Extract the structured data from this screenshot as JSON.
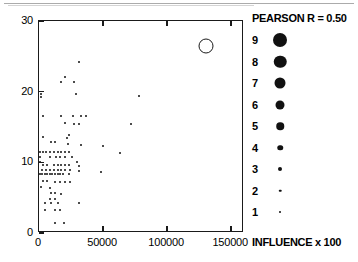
{
  "chart_data": {
    "type": "scatter",
    "title": "",
    "xlabel": "",
    "ylabel": "",
    "xlim": [
      0,
      160000
    ],
    "ylim": [
      0,
      30
    ],
    "grid": false,
    "xticks": [
      0,
      50000,
      100000,
      150000
    ],
    "xtick_labels": [
      "0",
      "50000",
      "100000",
      "150000"
    ],
    "yticks": [
      0,
      10,
      20,
      30
    ],
    "ytick_labels": [
      "0",
      "10",
      "20",
      "30"
    ],
    "legend_position": "right",
    "annotations": [
      "PEARSON R = 0.50",
      "INFLUENCE x 100"
    ],
    "size_legend": {
      "title": "PEARSON R = 0.50",
      "footer": "INFLUENCE x 100",
      "entries": [
        {
          "label": "9",
          "marker_px": 14
        },
        {
          "label": "8",
          "marker_px": 12.5
        },
        {
          "label": "7",
          "marker_px": 11
        },
        {
          "label": "6",
          "marker_px": 9
        },
        {
          "label": "5",
          "marker_px": 7.5
        },
        {
          "label": "4",
          "marker_px": 5.5
        },
        {
          "label": "3",
          "marker_px": 4
        },
        {
          "label": "2",
          "marker_px": 2.5
        },
        {
          "label": "1",
          "marker_px": 2
        }
      ]
    },
    "series": [
      {
        "name": "observations",
        "marker": "filled-circle",
        "color": "#111111",
        "points": [
          [
            1500,
            19.6,
            2
          ],
          [
            1200,
            19.3,
            2
          ],
          [
            20500,
            22.1,
            2
          ],
          [
            17500,
            21.3,
            2
          ],
          [
            27500,
            21.3,
            2
          ],
          [
            31000,
            24.2,
            2
          ],
          [
            28500,
            19.6,
            2
          ],
          [
            78000,
            19.4,
            2
          ],
          [
            3500,
            16.6,
            2
          ],
          [
            17500,
            16.6,
            2
          ],
          [
            26500,
            16.6,
            2
          ],
          [
            32500,
            16.6,
            2
          ],
          [
            36500,
            16.6,
            2
          ],
          [
            20500,
            15.5,
            2
          ],
          [
            27500,
            15.4,
            2
          ],
          [
            31000,
            15.4,
            2
          ],
          [
            71500,
            15.4,
            2
          ],
          [
            23500,
            13.9,
            2
          ],
          [
            3200,
            13.6,
            2
          ],
          [
            21500,
            13.5,
            2
          ],
          [
            9500,
            12.9,
            2
          ],
          [
            12500,
            12.9,
            2
          ],
          [
            23000,
            12.6,
            2
          ],
          [
            32500,
            12.4,
            2
          ],
          [
            50000,
            12.3,
            2
          ],
          [
            900,
            11.5,
            2
          ],
          [
            3000,
            11.5,
            2
          ],
          [
            5500,
            11.5,
            2
          ],
          [
            8500,
            11.5,
            2
          ],
          [
            11500,
            11.5,
            2
          ],
          [
            14500,
            11.5,
            2
          ],
          [
            17500,
            11.5,
            2
          ],
          [
            20500,
            11.5,
            2
          ],
          [
            23500,
            11.5,
            2
          ],
          [
            63000,
            11.3,
            2
          ],
          [
            600,
            10.8,
            2
          ],
          [
            8500,
            10.8,
            2
          ],
          [
            13500,
            10.8,
            2
          ],
          [
            16500,
            10.8,
            2
          ],
          [
            20500,
            10.8,
            2
          ],
          [
            25500,
            10.8,
            2
          ],
          [
            600,
            10.1,
            2
          ],
          [
            29500,
            10.0,
            2
          ],
          [
            3500,
            9.6,
            2
          ],
          [
            6500,
            9.6,
            2
          ],
          [
            11500,
            9.6,
            2
          ],
          [
            14500,
            9.6,
            2
          ],
          [
            17500,
            9.6,
            2
          ],
          [
            20500,
            9.6,
            2
          ],
          [
            23500,
            9.6,
            2
          ],
          [
            31000,
            9.5,
            2
          ],
          [
            2500,
            8.9,
            2
          ],
          [
            5500,
            8.9,
            2
          ],
          [
            8500,
            8.9,
            2
          ],
          [
            11500,
            8.9,
            2
          ],
          [
            14500,
            8.9,
            2
          ],
          [
            17500,
            8.9,
            2
          ],
          [
            20500,
            8.9,
            2
          ],
          [
            24500,
            8.9,
            2
          ],
          [
            31000,
            8.8,
            2
          ],
          [
            48500,
            8.7,
            2
          ],
          [
            600,
            8.3,
            2
          ],
          [
            2500,
            8.3,
            2
          ],
          [
            4500,
            8.3,
            2
          ],
          [
            6500,
            8.3,
            2
          ],
          [
            8500,
            8.3,
            2
          ],
          [
            10500,
            8.3,
            2
          ],
          [
            12500,
            8.3,
            2
          ],
          [
            14500,
            8.3,
            2
          ],
          [
            16500,
            8.3,
            2
          ],
          [
            18500,
            8.3,
            2
          ],
          [
            23500,
            8.3,
            2
          ],
          [
            3500,
            7.3,
            2
          ],
          [
            6000,
            7.3,
            2
          ],
          [
            12500,
            7.2,
            2
          ],
          [
            16500,
            7.2,
            2
          ],
          [
            20500,
            7.2,
            2
          ],
          [
            24500,
            7.2,
            2
          ],
          [
            1200,
            6.5,
            2
          ],
          [
            8500,
            6.4,
            2
          ],
          [
            9500,
            5.6,
            2
          ],
          [
            12500,
            5.6,
            2
          ],
          [
            17500,
            5.5,
            2
          ],
          [
            8500,
            4.8,
            2
          ],
          [
            12500,
            4.8,
            2
          ],
          [
            4500,
            4.3,
            2
          ],
          [
            9500,
            4.2,
            2
          ],
          [
            14500,
            4.2,
            2
          ],
          [
            31000,
            4.2,
            2
          ],
          [
            4500,
            3.3,
            2
          ],
          [
            12500,
            3.2,
            2
          ],
          [
            16500,
            3.2,
            2
          ],
          [
            12500,
            1.4,
            2
          ],
          [
            19500,
            1.4,
            2
          ]
        ]
      },
      {
        "name": "outlier",
        "marker": "open-circle",
        "color": "#1a1a1a",
        "points": [
          [
            130000,
            26.5,
            9
          ]
        ]
      }
    ]
  }
}
